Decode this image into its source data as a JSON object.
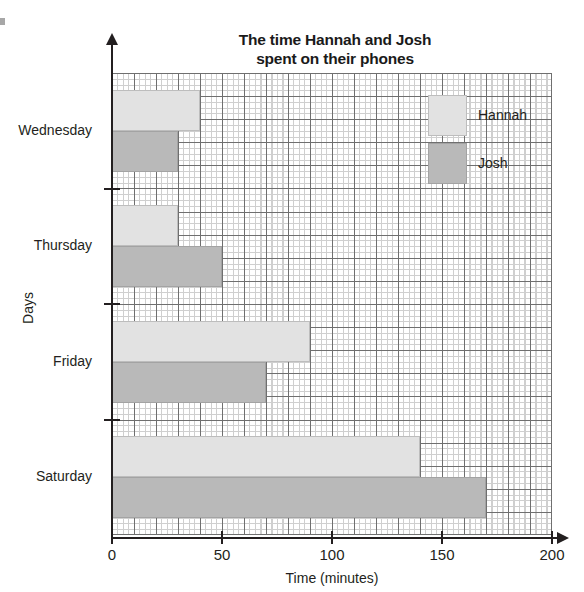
{
  "chart_data": {
    "type": "bar",
    "orientation": "horizontal",
    "title": "The time Hannah and Josh\nspent on their phones",
    "xlabel": "Time (minutes)",
    "ylabel": "Days",
    "categories": [
      "Wednesday",
      "Thursday",
      "Friday",
      "Saturday"
    ],
    "series": [
      {
        "name": "Hannah",
        "color": "#e2e2e2",
        "values": [
          40,
          30,
          90,
          140
        ]
      },
      {
        "name": "Josh",
        "color": "#b9b9b9",
        "values": [
          30,
          50,
          70,
          170
        ]
      }
    ],
    "xlim": [
      0,
      200
    ],
    "xticks": [
      0,
      50,
      100,
      150,
      200
    ],
    "xtick_labels": [
      "0",
      "50",
      "100",
      "150",
      "200"
    ],
    "grid": true,
    "grid_major_step": 10,
    "grid_minor_step": 2.5,
    "legend_position": "top-right",
    "legend_entries": [
      {
        "label": "Hannah",
        "color": "#e2e2e2"
      },
      {
        "label": "Josh",
        "color": "#b9b9b9"
      }
    ]
  }
}
